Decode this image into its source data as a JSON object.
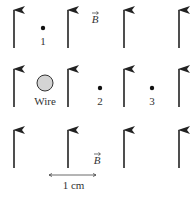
{
  "figure": {
    "field_label": "B",
    "field_labels": [
      {
        "text": "B",
        "x": 95,
        "y": 23
      },
      {
        "text": "B",
        "x": 97,
        "y": 164
      }
    ],
    "arrow_columns_x": [
      14,
      68,
      124,
      179
    ],
    "arrow_rows": [
      {
        "y_top": 9,
        "y_bottom": 48
      },
      {
        "y_top": 68,
        "y_bottom": 107
      },
      {
        "y_top": 129,
        "y_bottom": 168
      }
    ],
    "wire": {
      "label": "Wire",
      "cx": 45,
      "cy": 83,
      "r": 8,
      "fill": "#d4d4d4"
    },
    "points": [
      {
        "label": "1",
        "x": 43,
        "y": 28
      },
      {
        "label": "2",
        "x": 100,
        "y": 88
      },
      {
        "label": "3",
        "x": 152,
        "y": 88
      }
    ],
    "scale_bar": {
      "label": "1 cm",
      "x1": 49,
      "x2": 96,
      "y": 175
    }
  }
}
